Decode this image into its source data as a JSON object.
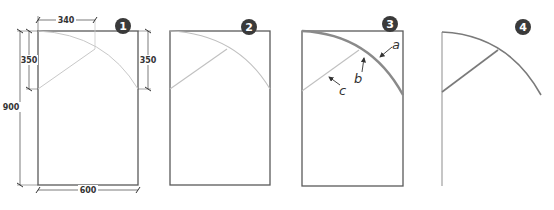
{
  "colors": {
    "frame": "#5a5a5a",
    "guide": "#c8c8c8",
    "arc_bold": "#8a8a8a",
    "dim_line": "#444444",
    "badge": "#3a3a3a",
    "background": "#ffffff"
  },
  "panels": [
    {
      "step": "1",
      "dimensions": {
        "top_width": "340",
        "left_short": "350",
        "left_full": "900",
        "right_short": "350",
        "bottom_width": "600"
      }
    },
    {
      "step": "2"
    },
    {
      "step": "3",
      "annotations": {
        "a": "a",
        "b": "b",
        "c": "c"
      }
    },
    {
      "step": "4"
    }
  ]
}
